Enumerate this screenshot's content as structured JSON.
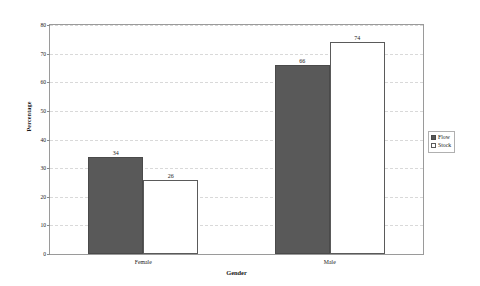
{
  "chart_data": {
    "type": "bar",
    "title": "",
    "xlabel": "Gender",
    "ylabel": "Percentage",
    "categories": [
      "Female",
      "Male"
    ],
    "series": [
      {
        "name": "Flow",
        "values": [
          34,
          66
        ],
        "color": "#595959"
      },
      {
        "name": "Stock",
        "values": [
          26,
          74
        ],
        "color": "#ffffff"
      }
    ],
    "ylim": [
      0,
      80
    ],
    "yticks": [
      0,
      10,
      20,
      30,
      40,
      50,
      60,
      70,
      80
    ],
    "ytick_labels": [
      "0",
      "10",
      "20",
      "30",
      "40",
      "50",
      "60",
      "70",
      "80"
    ],
    "grid": true,
    "grid_axis": "y",
    "grid_style": "dashed",
    "legend_position": "right-outside",
    "data_labels": [
      "34",
      "26",
      "66",
      "74"
    ],
    "frame": true
  },
  "axes": {
    "y_title": "Percentage",
    "x_title": "Gender"
  },
  "legend": {
    "entries": [
      {
        "label": "Flow",
        "swatch": "filled-gray-square"
      },
      {
        "label": "Stock",
        "swatch": "open-white-square"
      }
    ]
  }
}
